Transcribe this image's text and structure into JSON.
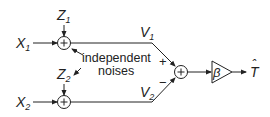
{
  "diagram": {
    "inputs": [
      {
        "label": "X",
        "subscript": "1"
      },
      {
        "label": "X",
        "subscript": "2"
      }
    ],
    "noises": [
      {
        "label": "Z",
        "subscript": "1"
      },
      {
        "label": "Z",
        "subscript": "2"
      }
    ],
    "intermediate": [
      {
        "label": "V",
        "subscript": "1"
      },
      {
        "label": "V",
        "subscript": "2"
      }
    ],
    "sum_symbol": "+",
    "annotation": {
      "line1": "independent",
      "line2": "noises"
    },
    "signs": {
      "plus": "+",
      "minus": "−"
    },
    "gain": {
      "label": "β"
    },
    "output": {
      "label": "T",
      "hat": "ˆ"
    },
    "colors": {
      "stroke": "#222222",
      "background": "#ffffff"
    }
  }
}
